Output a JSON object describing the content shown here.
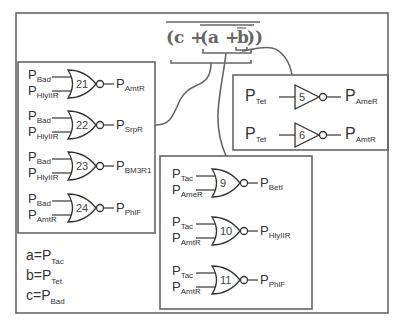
{
  "expression": {
    "outer": "(c + (a + b))",
    "parts": [
      "(c + ",
      "(a + ",
      "b",
      "))"
    ]
  },
  "legend": [
    {
      "var": "a=P",
      "sub": "Tac"
    },
    {
      "var": "b=P",
      "sub": "Tet"
    },
    {
      "var": "c=P",
      "sub": "Bad"
    }
  ],
  "left_group": {
    "gates": [
      {
        "id": "21",
        "type": "NOR",
        "in1": "Bad",
        "in2": "HlyIIR",
        "out": "AmtR"
      },
      {
        "id": "22",
        "type": "NOR",
        "in1": "Bad",
        "in2": "HlyIIR",
        "out": "SrpR"
      },
      {
        "id": "23",
        "type": "NOR",
        "in1": "Bad",
        "in2": "HlyIIR",
        "out": "BM3R1"
      },
      {
        "id": "24",
        "type": "NOR",
        "in1": "Bad",
        "in2": "AmtR",
        "out": "PhlF"
      }
    ]
  },
  "right_group": {
    "gates": [
      {
        "id": "5",
        "type": "NOT",
        "in": "Tet",
        "out": "AmeR"
      },
      {
        "id": "6",
        "type": "NOT",
        "in": "Tet",
        "out": "AmtR"
      }
    ]
  },
  "center_group": {
    "gates": [
      {
        "id": "9",
        "type": "NOR",
        "in1": "Tac",
        "in2": "AmeR",
        "out": "BetI"
      },
      {
        "id": "10",
        "type": "NOR",
        "in1": "Tac",
        "in2": "AmtR",
        "out": "HlyIIR"
      },
      {
        "id": "11",
        "type": "NOR",
        "in1": "Tac",
        "in2": "AmtR",
        "out": "PhlF"
      }
    ]
  },
  "P": "P"
}
